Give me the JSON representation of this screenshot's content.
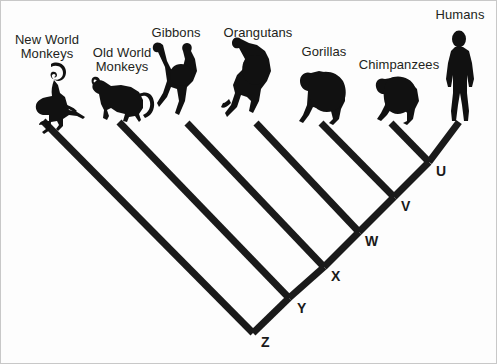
{
  "figure": {
    "kind": "cladogram",
    "background_color": "#fdfdfd",
    "line_color": "#1a1a1a",
    "silhouette_color": "#111111",
    "label_color": "#231f20"
  },
  "taxa": [
    {
      "id": "new-world-monkeys",
      "label": "New World\nMonkeys",
      "icon": "monkey-silhouette-icon",
      "label_x": 4,
      "label_y": 32,
      "label_w": 84,
      "tip_x": 42,
      "tip_y": 120
    },
    {
      "id": "old-world-monkeys",
      "label": "Old World\nMonkeys",
      "icon": "monkey-silhouette-icon",
      "label_x": 79,
      "label_y": 45,
      "label_w": 84,
      "tip_x": 118,
      "tip_y": 121
    },
    {
      "id": "gibbons",
      "label": "Gibbons",
      "icon": "gibbon-silhouette-icon",
      "label_x": 148,
      "label_y": 25,
      "label_w": 54,
      "tip_x": 186,
      "tip_y": 122
    },
    {
      "id": "orangutans",
      "label": "Orangutans",
      "icon": "orangutan-silhouette-icon",
      "label_x": 216,
      "label_y": 25,
      "label_w": 82,
      "tip_x": 255,
      "tip_y": 122
    },
    {
      "id": "gorillas",
      "label": "Gorillas",
      "icon": "gorilla-silhouette-icon",
      "label_x": 296,
      "label_y": 44,
      "label_w": 54,
      "tip_x": 320,
      "tip_y": 122
    },
    {
      "id": "chimpanzees",
      "label": "Chimpanzees",
      "icon": "chimpanzee-silhouette-icon",
      "label_x": 356,
      "label_y": 57,
      "label_w": 84,
      "tip_x": 390,
      "tip_y": 122
    },
    {
      "id": "humans",
      "label": "Humans",
      "icon": "human-silhouette-icon",
      "label_x": 430,
      "label_y": 7,
      "label_w": 58,
      "tip_x": 458,
      "tip_y": 121
    }
  ],
  "nodes": [
    {
      "id": "node-u",
      "label": "U",
      "x": 428,
      "y": 161,
      "label_x": 435,
      "label_y": 163
    },
    {
      "id": "node-v",
      "label": "V",
      "x": 393,
      "y": 196,
      "label_x": 400,
      "label_y": 198
    },
    {
      "id": "node-w",
      "label": "W",
      "x": 358,
      "y": 231,
      "label_x": 364,
      "label_y": 233
    },
    {
      "id": "node-x",
      "label": "X",
      "x": 323,
      "y": 266,
      "label_x": 330,
      "label_y": 268
    },
    {
      "id": "node-y",
      "label": "Y",
      "x": 288,
      "y": 297,
      "label_x": 296,
      "label_y": 300
    },
    {
      "id": "node-z",
      "label": "Z",
      "x": 252,
      "y": 332,
      "label_x": 260,
      "label_y": 334
    }
  ],
  "branches": [
    {
      "id": "branch-new-world-monkeys",
      "from": [
        42,
        120
      ],
      "to": [
        252,
        332
      ]
    },
    {
      "id": "branch-old-world-monkeys",
      "from": [
        118,
        121
      ],
      "to": [
        288,
        297
      ]
    },
    {
      "id": "branch-gibbons",
      "from": [
        186,
        122
      ],
      "to": [
        323,
        266
      ]
    },
    {
      "id": "branch-orangutans",
      "from": [
        255,
        122
      ],
      "to": [
        358,
        231
      ]
    },
    {
      "id": "branch-gorillas",
      "from": [
        320,
        122
      ],
      "to": [
        393,
        196
      ]
    },
    {
      "id": "branch-chimpanzees",
      "from": [
        390,
        122
      ],
      "to": [
        428,
        161
      ]
    },
    {
      "id": "branch-humans",
      "from": [
        458,
        121
      ],
      "to": [
        428,
        161
      ]
    },
    {
      "id": "branch-spine-z-y",
      "from": [
        252,
        332
      ],
      "to": [
        288,
        297
      ]
    },
    {
      "id": "branch-spine-y-x",
      "from": [
        288,
        297
      ],
      "to": [
        323,
        266
      ]
    },
    {
      "id": "branch-spine-x-w",
      "from": [
        323,
        266
      ],
      "to": [
        358,
        231
      ]
    },
    {
      "id": "branch-spine-w-v",
      "from": [
        358,
        231
      ],
      "to": [
        393,
        196
      ]
    },
    {
      "id": "branch-spine-v-u",
      "from": [
        393,
        196
      ],
      "to": [
        428,
        161
      ]
    }
  ],
  "chart_data": {
    "type": "diagram",
    "title": "",
    "tip_labels": [
      "New World Monkeys",
      "Old World Monkeys",
      "Gibbons",
      "Orangutans",
      "Gorillas",
      "Chimpanzees",
      "Humans"
    ],
    "internal_node_labels": [
      "U",
      "V",
      "W",
      "X",
      "Y",
      "Z"
    ],
    "topology": "(NewWorldMonkeys,(OldWorldMonkeys,(Gibbons,(Orangutans,(Gorillas,(Chimpanzees,Humans)U)V)W)X)Y)Z"
  }
}
